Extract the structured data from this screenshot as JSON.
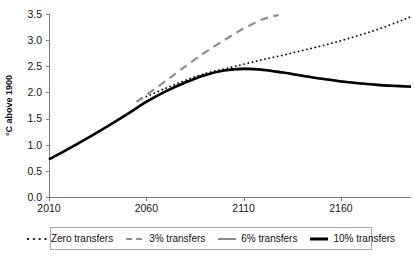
{
  "figure": {
    "top_clipped_caption": "",
    "background": "#ffffff"
  },
  "axes": {
    "ylabel": "°C above 1900",
    "y_ticks": [
      "0.0",
      "0.5",
      "1.0",
      "1.5",
      "2.0",
      "2.5",
      "3.0",
      "3.5"
    ],
    "x_ticks": [
      "2010",
      "2060",
      "2110",
      "2160"
    ],
    "axis_color": "#7d7d7d"
  },
  "legend": {
    "items": [
      {
        "label": "Zero transfers",
        "style": "dotted",
        "color": "#111111"
      },
      {
        "label": "3% transfers",
        "style": "dashed",
        "color": "#8f8f8f"
      },
      {
        "label": "6% transfers",
        "style": "solid-thin",
        "color": "#767676"
      },
      {
        "label": "10% transfers",
        "style": "solid-thick",
        "color": "#000000"
      }
    ]
  },
  "chart_data": {
    "type": "line",
    "title": "",
    "xlabel": "",
    "ylabel": "°C above 1900",
    "xlim": [
      2010,
      2196
    ],
    "ylim": [
      0.0,
      3.5
    ],
    "xticks": [
      2010,
      2060,
      2110,
      2160
    ],
    "yticks": [
      0.0,
      0.5,
      1.0,
      1.5,
      2.0,
      2.5,
      3.0,
      3.5
    ],
    "grid": false,
    "legend_position": "below",
    "x": [
      2010,
      2020,
      2030,
      2040,
      2050,
      2060,
      2070,
      2080,
      2090,
      2100,
      2110,
      2120,
      2130,
      2140,
      2150,
      2160,
      2170,
      2180,
      2190,
      2196
    ],
    "series": [
      {
        "name": "Zero transfers",
        "style": "dotted",
        "color": "#111111",
        "x": [
          2060,
          2070,
          2080,
          2090,
          2100,
          2110,
          2120,
          2130,
          2140,
          2150,
          2160,
          2170,
          2180,
          2190,
          2196
        ],
        "values": [
          1.92,
          2.08,
          2.23,
          2.36,
          2.45,
          2.54,
          2.63,
          2.71,
          2.8,
          2.89,
          2.99,
          3.1,
          3.22,
          3.36,
          3.45
        ]
      },
      {
        "name": "3% transfers",
        "style": "dashed",
        "color": "#8f8f8f",
        "x": [
          2055,
          2060,
          2070,
          2080,
          2090,
          2100,
          2110,
          2120,
          2128
        ],
        "values": [
          1.82,
          1.95,
          2.22,
          2.5,
          2.76,
          3.0,
          3.22,
          3.4,
          3.48
        ]
      },
      {
        "name": "6% transfers",
        "style": "solid-thin",
        "color": "#767676",
        "x": [
          2010,
          2020,
          2030,
          2040,
          2050,
          2060,
          2070,
          2080,
          2090,
          2100,
          2110,
          2120,
          2130,
          2140,
          2150,
          2160,
          2170,
          2180,
          2190,
          2196
        ],
        "values": [
          0.72,
          0.92,
          1.13,
          1.35,
          1.58,
          1.83,
          2.03,
          2.2,
          2.34,
          2.43,
          2.46,
          2.44,
          2.39,
          2.33,
          2.27,
          2.22,
          2.18,
          2.15,
          2.13,
          2.12
        ]
      },
      {
        "name": "10% transfers",
        "style": "solid-thick",
        "color": "#000000",
        "x": [
          2010,
          2020,
          2030,
          2040,
          2050,
          2060,
          2070,
          2080,
          2090,
          2100,
          2110,
          2120,
          2130,
          2140,
          2150,
          2160,
          2170,
          2180,
          2190,
          2196
        ],
        "values": [
          0.72,
          0.92,
          1.13,
          1.35,
          1.58,
          1.82,
          2.02,
          2.19,
          2.33,
          2.42,
          2.45,
          2.43,
          2.38,
          2.32,
          2.26,
          2.21,
          2.17,
          2.14,
          2.12,
          2.11
        ]
      }
    ]
  }
}
